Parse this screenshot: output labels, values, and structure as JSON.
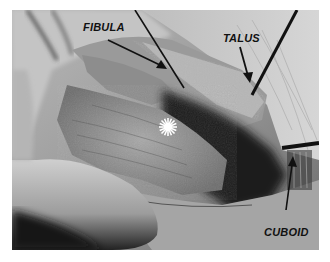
{
  "figure": {
    "type": "grayscale intraoperative photograph",
    "labels": {
      "fibula": "FIBULA",
      "talus": "TALUS",
      "cuboid": "CUBOID"
    },
    "markers": [
      {
        "name": "asterisk",
        "glyph": "✱",
        "color": "#ffffff"
      }
    ],
    "colors": {
      "background": "#ffffff",
      "label_text": "#111111",
      "arrow": "#111111"
    }
  }
}
